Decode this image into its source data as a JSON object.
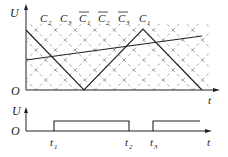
{
  "top_plot": {
    "y_axis_label": "U",
    "origin_label": "O",
    "x_axis_label": "t",
    "capacitor_labels": [
      {
        "base": "C",
        "sub": "2",
        "overline": false
      },
      {
        "base": "C",
        "sub": "3",
        "overline": false
      },
      {
        "base": "C",
        "sub": "1",
        "overline": true
      },
      {
        "base": "C",
        "sub": "2",
        "overline": true
      },
      {
        "base": "C",
        "sub": "3",
        "overline": true
      },
      {
        "base": "C",
        "sub": "1",
        "overline": false
      }
    ],
    "series": {
      "triangle_wave": "descending from top at t=0 to zero, rising to peak, descending to zero",
      "reference_line": "slowly rising straight line"
    }
  },
  "bottom_plot": {
    "y_axis_label": "U",
    "origin_label": "O",
    "x_axis_label": "t",
    "time_marks": [
      {
        "base": "t",
        "sub": "1"
      },
      {
        "base": "t",
        "sub": "2"
      },
      {
        "base": "t",
        "sub": "3"
      }
    ]
  },
  "colors": {
    "line": "#222222",
    "hatch": "#8a8a8a"
  }
}
